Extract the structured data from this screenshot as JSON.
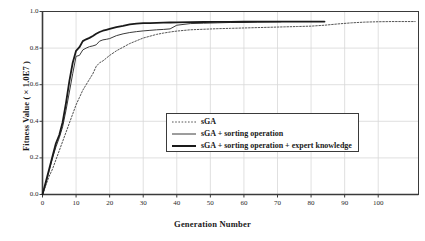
{
  "chart_data": {
    "type": "line",
    "title": "",
    "xlabel": "Generation Number",
    "ylabel": "Fitness Value ( × 1.0E7 )",
    "xlim": [
      0,
      112
    ],
    "ylim": [
      0.0,
      1.0
    ],
    "grid": true,
    "legend_position": "center",
    "xticks": [
      0,
      10,
      20,
      30,
      40,
      50,
      60,
      70,
      80,
      90,
      100
    ],
    "xtick_labels": [
      "0",
      "10",
      "20",
      "30",
      "40",
      "50",
      "60",
      "70",
      "80",
      "90",
      "100"
    ],
    "yticks": [
      0.0,
      0.2,
      0.4,
      0.6,
      0.8,
      1.0
    ],
    "ytick_labels": [
      "0.0",
      "0.2",
      "0.4",
      "0.6",
      "0.8",
      "1.0"
    ],
    "series": [
      {
        "name": "sGA",
        "style": "dotted",
        "color": "#555555",
        "width": 1.0,
        "x": [
          0,
          1,
          2,
          3,
          4,
          5,
          6,
          7,
          8,
          9,
          10,
          11,
          12,
          13,
          14,
          15,
          16,
          17,
          18,
          19,
          20,
          22,
          24,
          26,
          28,
          30,
          32,
          34,
          36,
          38,
          40,
          44,
          48,
          52,
          56,
          60,
          64,
          68,
          72,
          76,
          80,
          84,
          88,
          92,
          96,
          100,
          104,
          108,
          111
        ],
        "y": [
          0.0,
          0.05,
          0.1,
          0.14,
          0.19,
          0.24,
          0.29,
          0.34,
          0.39,
          0.44,
          0.49,
          0.53,
          0.57,
          0.6,
          0.63,
          0.66,
          0.7,
          0.72,
          0.73,
          0.745,
          0.76,
          0.785,
          0.805,
          0.825,
          0.84,
          0.855,
          0.865,
          0.875,
          0.882,
          0.888,
          0.893,
          0.9,
          0.903,
          0.906,
          0.908,
          0.91,
          0.912,
          0.914,
          0.916,
          0.918,
          0.92,
          0.925,
          0.932,
          0.938,
          0.942,
          0.944,
          0.945,
          0.945,
          0.945
        ]
      },
      {
        "name": "sGA + sorting operation",
        "style": "solid",
        "color": "#3a3a3a",
        "width": 1.0,
        "x": [
          0,
          1,
          2,
          3,
          4,
          5,
          6,
          7,
          8,
          9,
          10,
          11,
          12,
          13,
          14,
          15,
          16,
          17,
          18,
          19,
          20,
          22,
          24,
          26,
          28,
          30,
          32,
          34,
          36,
          38,
          40,
          44,
          48,
          52,
          56,
          60,
          64,
          68,
          71
        ],
        "y": [
          0.0,
          0.06,
          0.13,
          0.2,
          0.26,
          0.31,
          0.37,
          0.46,
          0.56,
          0.66,
          0.755,
          0.76,
          0.79,
          0.8,
          0.808,
          0.812,
          0.818,
          0.838,
          0.845,
          0.848,
          0.852,
          0.868,
          0.878,
          0.885,
          0.89,
          0.894,
          0.897,
          0.9,
          0.902,
          0.905,
          0.925,
          0.934,
          0.936,
          0.938,
          0.94,
          0.941,
          0.942,
          0.943,
          0.944
        ]
      },
      {
        "name": "sGA + sorting operation + expert knowledge",
        "style": "solid",
        "color": "#1a1a1a",
        "width": 1.8,
        "x": [
          0,
          1,
          2,
          3,
          4,
          5,
          6,
          7,
          8,
          9,
          10,
          11,
          12,
          13,
          14,
          15,
          16,
          17,
          18,
          19,
          20,
          22,
          24,
          26,
          28,
          30,
          32,
          34,
          36,
          38,
          40,
          44,
          48,
          52,
          56,
          60,
          64,
          68,
          72,
          76,
          80,
          84
        ],
        "y": [
          0.0,
          0.07,
          0.14,
          0.21,
          0.28,
          0.325,
          0.395,
          0.5,
          0.62,
          0.72,
          0.785,
          0.805,
          0.838,
          0.848,
          0.856,
          0.866,
          0.878,
          0.888,
          0.895,
          0.9,
          0.905,
          0.915,
          0.922,
          0.93,
          0.934,
          0.936,
          0.937,
          0.938,
          0.939,
          0.94,
          0.941,
          0.942,
          0.9425,
          0.943,
          0.9435,
          0.944,
          0.9442,
          0.9445,
          0.9448,
          0.945,
          0.945,
          0.945
        ]
      }
    ]
  },
  "legend": {
    "entries": [
      {
        "label": "sGA",
        "style": "dotted"
      },
      {
        "label": "sGA + sorting operation",
        "style": "thin-solid"
      },
      {
        "label": "sGA + sorting operation + expert knowledge",
        "style": "thick-solid"
      }
    ]
  },
  "colors": {
    "axis": "#3a3a3a",
    "grid": "#d8d8d8",
    "text": "#1a1a1a",
    "background": "#ffffff"
  }
}
